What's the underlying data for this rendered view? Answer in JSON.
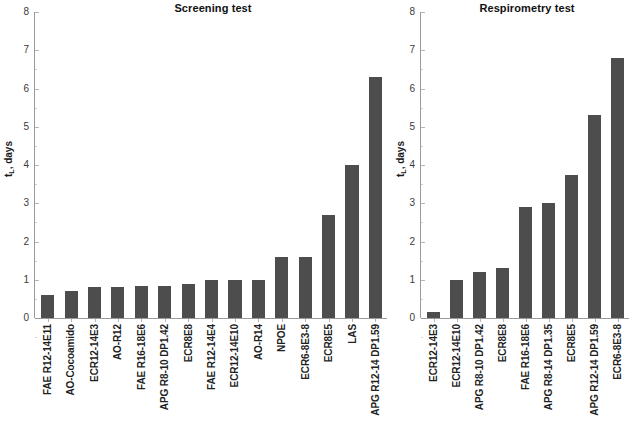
{
  "figure": {
    "ylabel_text": "t",
    "ylabel_sub": "L",
    "ylabel_suffix": ", days",
    "bar_color": "#4d4d4d",
    "axis_color": "#9a9a9a"
  },
  "chart_data": [
    {
      "type": "bar",
      "title": "Screening test",
      "xlabel": "",
      "ylabel": "tL, days",
      "ylim": [
        0,
        8
      ],
      "yticks": [
        0,
        1,
        2,
        3,
        4,
        5,
        6,
        7,
        8
      ],
      "grid": false,
      "legend": "none",
      "categories": [
        "FAE R12-14E11",
        "AO-Cocoamido",
        "ECR12-14E3",
        "AO-R12",
        "FAE R16-18E6",
        "APG R8-10 DP1.42",
        "ECR8E8",
        "FAE R12-14E4",
        "ECR12-14E10",
        "AO-R14",
        "NPOE",
        "ECR6-8E3-8",
        "ECR8E5",
        "LAS",
        "APG R12-14 DP1.59"
      ],
      "values": [
        0.6,
        0.7,
        0.8,
        0.8,
        0.85,
        0.85,
        0.9,
        1.0,
        1.0,
        1.0,
        1.6,
        1.6,
        2.7,
        4.0,
        6.3
      ]
    },
    {
      "type": "bar",
      "title": "Respirometry test",
      "xlabel": "",
      "ylabel": "tL, days",
      "ylim": [
        0,
        8
      ],
      "yticks": [
        0,
        1,
        2,
        3,
        4,
        5,
        6,
        7,
        8
      ],
      "grid": false,
      "legend": "none",
      "categories": [
        "ECR12-14E3",
        "ECR12-14E10",
        "APG R8-10 DP1.42",
        "ECR8E8",
        "FAE R16-18E6",
        "APG R8-14 DP1.35",
        "ECR8E5",
        "APG R12-14 DP1.59",
        "ECR6-8E3-8"
      ],
      "values": [
        0.15,
        1.0,
        1.2,
        1.3,
        2.9,
        3.0,
        3.75,
        5.3,
        6.8
      ]
    }
  ]
}
